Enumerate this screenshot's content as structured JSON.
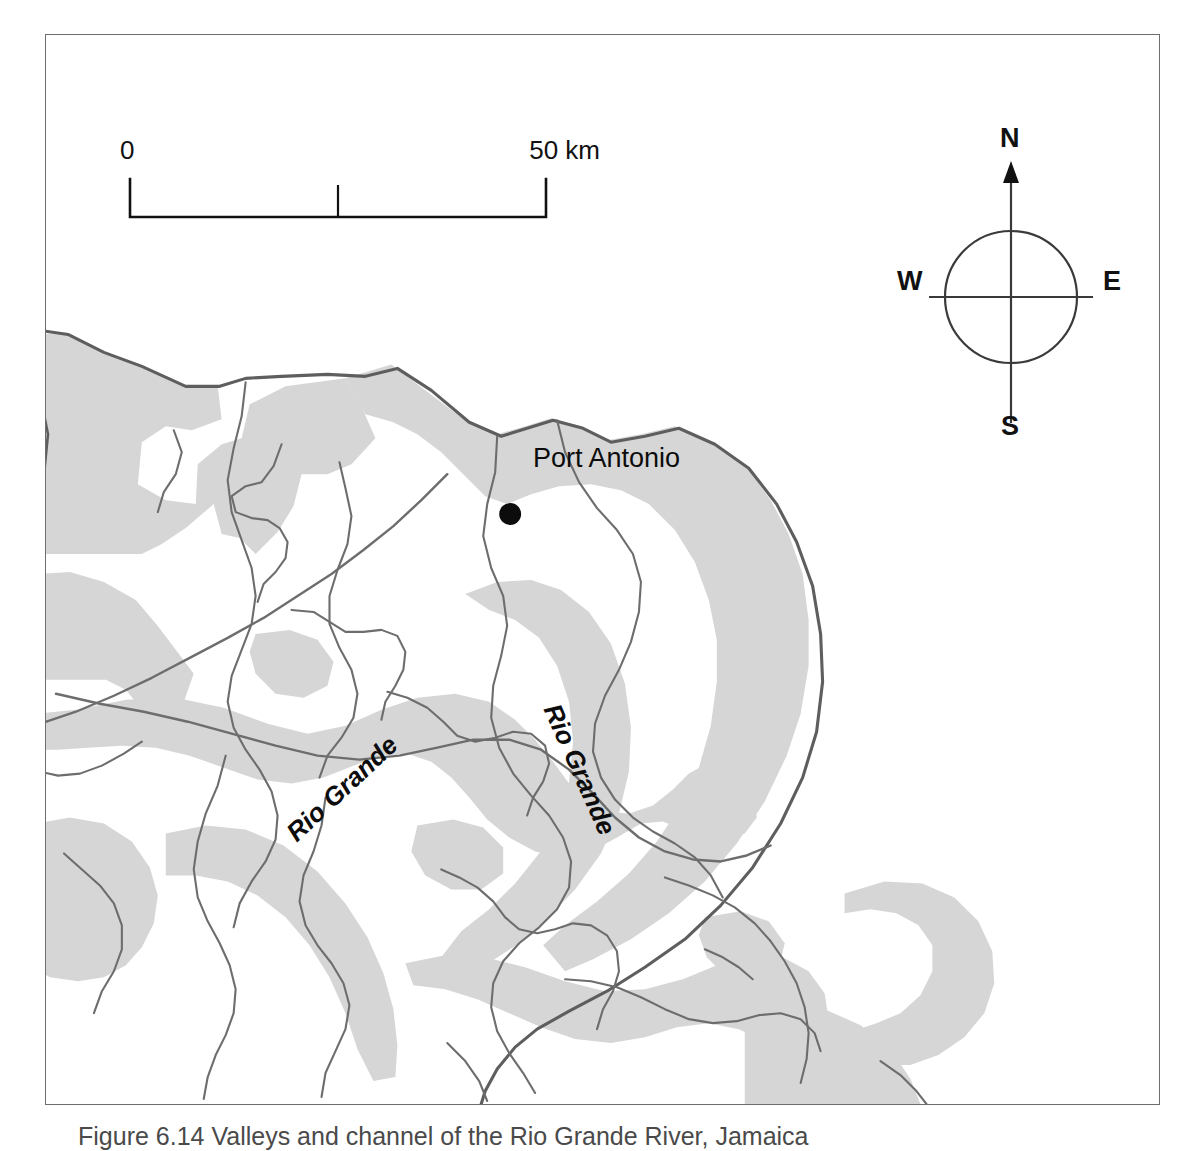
{
  "figure": {
    "caption": "Figure 6.14 Valleys and channel of the Rio Grande River, Jamaica"
  },
  "map": {
    "scale_bar": {
      "min_label": "0",
      "max_label": "50 km",
      "ticks": [
        "0",
        "25",
        "50"
      ],
      "units": "km",
      "length_km": 50
    },
    "compass": {
      "north": "N",
      "south": "S",
      "east": "E",
      "west": "W"
    },
    "settlements": [
      {
        "name": "Port Antonio",
        "marker": "filled-circle"
      }
    ],
    "rivers": [
      {
        "name": "Rio Grande",
        "placement": "lower-left-branch"
      },
      {
        "name": "Rio Grande",
        "placement": "main-channel-to-coast"
      }
    ],
    "colors": {
      "valley_fill": "#d6d6d6",
      "river_line": "#6d6d6d",
      "coastline": "#5e5e5e",
      "frame": "#6e6e6e",
      "land": "#ffffff",
      "label_text": "#0c0c0c"
    },
    "legend_note": "Shaded areas denote valley floors; thin lines denote river channels."
  }
}
